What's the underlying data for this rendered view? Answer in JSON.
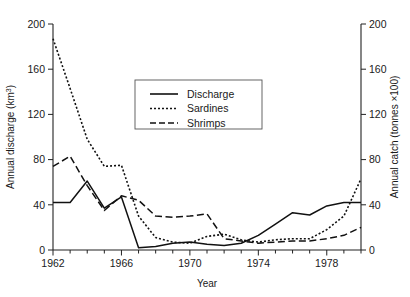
{
  "chart_data": {
    "type": "line",
    "title": "",
    "xlabel": "Year",
    "ylabel": "Annual discharge (km3)",
    "ylabel_right": "Annual catch (tonnes x100)",
    "xlim": [
      1962,
      1980
    ],
    "ylim": [
      0,
      200
    ],
    "ylim_right": [
      0,
      200
    ],
    "grid": false,
    "legend_position": "upper center",
    "x_ticks": [
      1962,
      1966,
      1970,
      1974,
      1978
    ],
    "x_tick_labels": [
      "1962",
      "1966",
      "1970",
      "1974",
      "1978"
    ],
    "x_minor_ticks": [
      1963,
      1964,
      1965,
      1967,
      1968,
      1969,
      1971,
      1972,
      1973,
      1975,
      1976,
      1977,
      1979,
      1980
    ],
    "y_ticks": [
      0,
      40,
      80,
      120,
      160,
      200
    ],
    "y_tick_labels": [
      "0",
      "40",
      "80",
      "120",
      "160",
      "200"
    ],
    "y_ticks_right": [
      0,
      40,
      80,
      120,
      160,
      200
    ],
    "y_tick_labels_right": [
      "0",
      "40",
      "80",
      "120",
      "160",
      "200"
    ],
    "x": [
      1962,
      1963,
      1964,
      1965,
      1966,
      1967,
      1968,
      1969,
      1970,
      1971,
      1972,
      1973,
      1974,
      1975,
      1976,
      1977,
      1978,
      1979,
      1980
    ],
    "series": [
      {
        "name": "Discharge",
        "style": "solid",
        "axis": "left",
        "values": [
          42,
          42,
          61,
          37,
          47,
          2,
          3,
          6,
          7,
          5,
          4,
          6,
          13,
          23,
          33,
          31,
          39,
          42,
          42
        ]
      },
      {
        "name": "Sardines",
        "style": "dotted",
        "axis": "right",
        "values": [
          187,
          143,
          98,
          74,
          75,
          30,
          11,
          7,
          6,
          12,
          14,
          9,
          7,
          9,
          10,
          10,
          18,
          30,
          63
        ]
      },
      {
        "name": "Shrimps",
        "style": "dashed",
        "axis": "right",
        "values": [
          74,
          83,
          57,
          35,
          48,
          44,
          30,
          29,
          30,
          32,
          10,
          8,
          6,
          7,
          8,
          8,
          10,
          13,
          20
        ]
      }
    ]
  },
  "axes": {
    "left_title_main": "Annual discharge (km",
    "left_title_sup": "3",
    "left_title_end": ")",
    "right_title": "Annual catch (tonnes ×100)",
    "bottom_title": "Year"
  },
  "legend": {
    "entries": [
      {
        "label": "Discharge",
        "style": "solid"
      },
      {
        "label": "Sardines",
        "style": "dotted"
      },
      {
        "label": "Shrimps",
        "style": "dashed"
      }
    ]
  }
}
